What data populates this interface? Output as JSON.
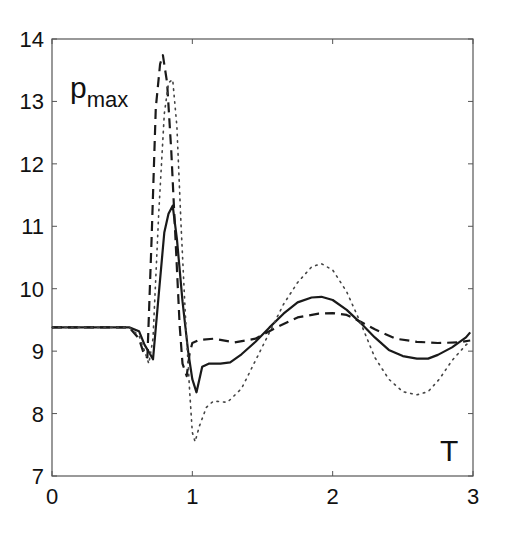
{
  "chart_data": {
    "type": "line",
    "title": "",
    "xlabel": "T",
    "ylabel": "p_max",
    "ylabel_main": "p",
    "ylabel_sub": "max",
    "xlim": [
      0,
      3
    ],
    "ylim": [
      7,
      14
    ],
    "xticks": [
      0,
      1,
      2,
      3
    ],
    "yticks": [
      7,
      8,
      9,
      10,
      11,
      12,
      13,
      14
    ],
    "grid": false,
    "legend": null,
    "series": [
      {
        "name": "solid",
        "style": "solid",
        "x": [
          0,
          0.2,
          0.4,
          0.55,
          0.62,
          0.66,
          0.7,
          0.72,
          0.76,
          0.8,
          0.83,
          0.86,
          0.89,
          0.93,
          0.97,
          1.0,
          1.03,
          1.07,
          1.12,
          1.2,
          1.27,
          1.35,
          1.45,
          1.55,
          1.65,
          1.75,
          1.85,
          1.92,
          2.0,
          2.1,
          2.2,
          2.3,
          2.4,
          2.5,
          2.6,
          2.68,
          2.75,
          2.85,
          2.95,
          2.98
        ],
        "y": [
          9.38,
          9.38,
          9.38,
          9.38,
          9.32,
          9.1,
          8.95,
          8.87,
          9.9,
          10.9,
          11.2,
          11.33,
          10.8,
          9.8,
          9.0,
          8.55,
          8.34,
          8.75,
          8.8,
          8.8,
          8.82,
          8.95,
          9.15,
          9.38,
          9.6,
          9.78,
          9.86,
          9.87,
          9.82,
          9.66,
          9.45,
          9.22,
          9.02,
          8.92,
          8.88,
          8.88,
          8.94,
          9.06,
          9.22,
          9.3
        ]
      },
      {
        "name": "dashed",
        "style": "dashed",
        "x": [
          0,
          0.2,
          0.4,
          0.55,
          0.62,
          0.66,
          0.68,
          0.71,
          0.74,
          0.77,
          0.79,
          0.82,
          0.85,
          0.88,
          0.91,
          0.93,
          0.96,
          0.98,
          1.0,
          1.05,
          1.15,
          1.3,
          1.45,
          1.6,
          1.75,
          1.9,
          2.0,
          2.1,
          2.2,
          2.3,
          2.45,
          2.6,
          2.75,
          2.9,
          2.98
        ],
        "y": [
          9.38,
          9.38,
          9.38,
          9.38,
          9.2,
          8.92,
          8.9,
          10.8,
          12.9,
          13.6,
          13.74,
          13.3,
          12.2,
          10.8,
          9.4,
          8.8,
          8.6,
          8.95,
          9.13,
          9.18,
          9.2,
          9.14,
          9.2,
          9.38,
          9.54,
          9.6,
          9.61,
          9.58,
          9.47,
          9.35,
          9.2,
          9.15,
          9.13,
          9.14,
          9.17
        ]
      },
      {
        "name": "dotted",
        "style": "dotted",
        "x": [
          0,
          0.2,
          0.4,
          0.55,
          0.62,
          0.66,
          0.69,
          0.72,
          0.76,
          0.8,
          0.83,
          0.86,
          0.89,
          0.92,
          0.95,
          0.98,
          1.0,
          1.02,
          1.05,
          1.1,
          1.15,
          1.25,
          1.35,
          1.45,
          1.55,
          1.65,
          1.75,
          1.85,
          1.92,
          2.0,
          2.1,
          2.2,
          2.3,
          2.4,
          2.5,
          2.6,
          2.68,
          2.76,
          2.85,
          2.95,
          2.98
        ],
        "y": [
          9.38,
          9.38,
          9.38,
          9.38,
          9.25,
          9.0,
          8.8,
          9.2,
          11.2,
          12.8,
          13.3,
          13.35,
          12.6,
          11.0,
          9.6,
          8.4,
          7.7,
          7.55,
          7.8,
          8.1,
          8.2,
          8.18,
          8.4,
          8.85,
          9.3,
          9.75,
          10.1,
          10.35,
          10.4,
          10.3,
          9.95,
          9.45,
          8.9,
          8.55,
          8.35,
          8.3,
          8.35,
          8.55,
          8.85,
          9.1,
          9.15
        ]
      }
    ]
  }
}
